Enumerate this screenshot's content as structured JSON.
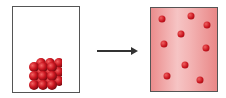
{
  "diagram": {
    "left_container": {
      "label": "",
      "state": "solid",
      "particle_grid": {
        "rows": 3,
        "cols": 3,
        "layers": 2
      }
    },
    "arrow": {
      "direction": "right"
    },
    "right_container": {
      "label": "",
      "state": "gas",
      "particle_count": 9,
      "particles": [
        [
          162,
          19
        ],
        [
          191,
          16
        ],
        [
          207,
          25
        ],
        [
          181,
          34
        ],
        [
          164,
          44
        ],
        [
          206,
          48
        ],
        [
          185,
          65
        ],
        [
          167,
          76
        ],
        [
          200,
          80
        ]
      ]
    },
    "colors": {
      "particle": "#c8141e",
      "gas_fill": "#f3b3b3",
      "border": "#555555"
    }
  }
}
